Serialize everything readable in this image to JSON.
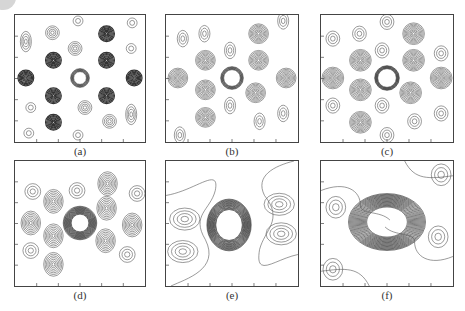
{
  "figure": {
    "panels": [
      {
        "id": "a",
        "label": "(a)",
        "style": "dense-dark-spots"
      },
      {
        "id": "b",
        "label": "(b)",
        "style": "spots"
      },
      {
        "id": "c",
        "label": "(c)",
        "style": "spots-bridged"
      },
      {
        "id": "d",
        "label": "(d)",
        "style": "spots-thick-ring"
      },
      {
        "id": "e",
        "label": "(e)",
        "style": "lobes"
      },
      {
        "id": "f",
        "label": "(f)",
        "style": "broad-ring"
      }
    ],
    "colors": {
      "line": "#555555",
      "dark": "#222222",
      "frame": "#444444"
    }
  }
}
